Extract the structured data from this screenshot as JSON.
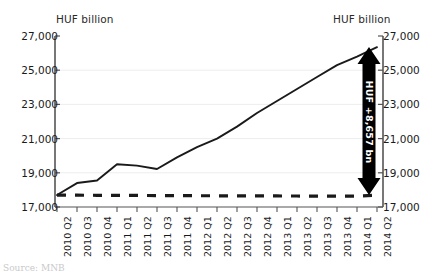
{
  "chart_data": {
    "type": "line",
    "title": "",
    "subtitle": "",
    "xlabel": "",
    "ylabel": "HUF billion",
    "ylabel_right": "HUF billion",
    "ylim": [
      17000,
      27000
    ],
    "ytick_step": 2000,
    "yticks": [
      "17,000",
      "19,000",
      "21,000",
      "23,000",
      "25,000",
      "27,000"
    ],
    "ytick_values": [
      17000,
      19000,
      21000,
      23000,
      25000,
      27000
    ],
    "grid": true,
    "legend": "none",
    "categories": [
      "2010 Q2",
      "2010 Q3",
      "2010 Q4",
      "2011 Q1",
      "2011 Q2",
      "2011 Q3",
      "2011 Q4",
      "2012 Q1",
      "2012 Q2",
      "2012 Q3",
      "2012 Q4",
      "2013 Q1",
      "2013 Q2",
      "2013 Q3",
      "2013 Q4",
      "2014 Q1",
      "2014 Q2"
    ],
    "series": [
      {
        "name": "actual",
        "style": "solid",
        "color": "#1a1a1a",
        "values": [
          17700,
          18400,
          18550,
          19500,
          19420,
          19220,
          19900,
          20500,
          21000,
          21700,
          22500,
          23200,
          23900,
          24600,
          25300,
          25800,
          26350
        ]
      },
      {
        "name": "baseline",
        "style": "dashed",
        "color": "#1a1a1a",
        "values": [
          17700,
          17690,
          17685,
          17680,
          17675,
          17670,
          17665,
          17660,
          17655,
          17650,
          17648,
          17645,
          17642,
          17640,
          17638,
          17636,
          17693
        ]
      }
    ],
    "annotations": [
      {
        "name": "growth-arrow",
        "text": "HUF +8,657 bn",
        "value": 8657,
        "from": 17693,
        "to": 26350,
        "at_category": "2014 Q2",
        "orientation": "vertical",
        "arrow": "double",
        "color": "#000000",
        "text_color": "#ffffff"
      }
    ]
  },
  "footer": {
    "source": "Source: MNB"
  }
}
